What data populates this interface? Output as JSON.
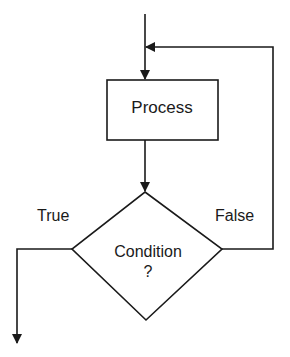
{
  "diagram": {
    "type": "flowchart-loop",
    "nodes": {
      "process": {
        "shape": "rectangle",
        "label": "Process"
      },
      "condition": {
        "shape": "diamond",
        "label_line1": "Condition",
        "label_line2": "?"
      }
    },
    "edges": {
      "entry": {
        "from": "top",
        "to": "process"
      },
      "process_to_condition": {
        "from": "process",
        "to": "condition"
      },
      "true_branch": {
        "from": "condition",
        "to": "exit",
        "label": "True"
      },
      "false_branch": {
        "from": "condition",
        "to": "process",
        "label": "False"
      }
    },
    "colors": {
      "stroke": "#1a1a1a",
      "background": "#ffffff"
    }
  }
}
